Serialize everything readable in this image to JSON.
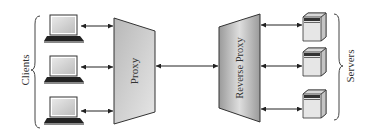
{
  "diagram": {
    "clients_label": "Clients",
    "proxy_label": "Proxy",
    "reverse_proxy_label": "Reverse Proxy",
    "servers_label": "Servers",
    "clients": [
      {
        "id": "client-1",
        "icon": "laptop-icon"
      },
      {
        "id": "client-2",
        "icon": "laptop-icon"
      },
      {
        "id": "client-3",
        "icon": "laptop-icon"
      }
    ],
    "servers": [
      {
        "id": "server-1",
        "icon": "server-tower-icon"
      },
      {
        "id": "server-2",
        "icon": "server-tower-icon"
      },
      {
        "id": "server-3",
        "icon": "server-tower-icon"
      }
    ],
    "connections": [
      {
        "from": "client-1",
        "to": "proxy",
        "type": "bidirectional"
      },
      {
        "from": "client-2",
        "to": "proxy",
        "type": "bidirectional"
      },
      {
        "from": "client-3",
        "to": "proxy",
        "type": "bidirectional"
      },
      {
        "from": "proxy",
        "to": "reverse-proxy",
        "type": "bidirectional"
      },
      {
        "from": "reverse-proxy",
        "to": "server-1",
        "type": "bidirectional"
      },
      {
        "from": "reverse-proxy",
        "to": "server-2",
        "type": "bidirectional"
      },
      {
        "from": "reverse-proxy",
        "to": "server-3",
        "type": "bidirectional"
      }
    ],
    "colors": {
      "proxy_fill": "#c8c8c8",
      "reverse_proxy_fill": "#a8a8a8",
      "stroke": "#333333"
    }
  }
}
